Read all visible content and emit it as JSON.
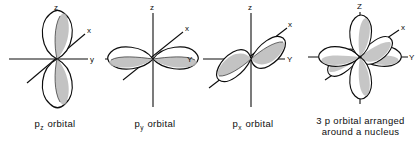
{
  "figure": {
    "background_color": "#ffffff",
    "ink_color": "#0d0d0d",
    "lobe_shade_color": "#b8b8b8",
    "width": 418,
    "height": 145
  },
  "panels": [
    {
      "id": "pz-orbital",
      "caption_main": "p",
      "caption_sub": "z",
      "caption_rest": "orbital",
      "axes": [
        {
          "name": "z-axis",
          "label": "z",
          "orientation": "vertical"
        },
        {
          "name": "y-axis",
          "label": "y",
          "orientation": "horizontal"
        },
        {
          "name": "x-axis",
          "label": "x",
          "orientation": "diagonal"
        }
      ],
      "lobes": 2,
      "lobe_axis": "z"
    },
    {
      "id": "py-orbital",
      "caption_main": "p",
      "caption_sub": "y",
      "caption_rest": "orbital",
      "axes": [
        {
          "name": "z-axis",
          "label": "z",
          "orientation": "vertical"
        },
        {
          "name": "y-axis",
          "label": "Y",
          "orientation": "horizontal"
        },
        {
          "name": "x-axis",
          "label": "x",
          "orientation": "diagonal"
        }
      ],
      "lobes": 2,
      "lobe_axis": "y"
    },
    {
      "id": "px-orbital",
      "caption_main": "p",
      "caption_sub": "x",
      "caption_rest": "orbital",
      "axes": [
        {
          "name": "z-axis",
          "label": "z",
          "orientation": "vertical"
        },
        {
          "name": "y-axis",
          "label": "Y",
          "orientation": "horizontal"
        },
        {
          "name": "x-axis",
          "label": "x",
          "orientation": "diagonal"
        }
      ],
      "lobes": 2,
      "lobe_axis": "x"
    },
    {
      "id": "three-p-orbital-nucleus",
      "caption_line1": "3 p orbital  arranged",
      "caption_line2": "around a nucleus",
      "axes": [
        {
          "name": "z-axis",
          "label": "Z",
          "orientation": "vertical"
        },
        {
          "name": "y-axis",
          "label": "Y",
          "orientation": "horizontal"
        },
        {
          "name": "x-axis",
          "label": "x",
          "orientation": "diagonal"
        }
      ],
      "lobes": 6,
      "lobe_axis": "x+y+z"
    }
  ]
}
